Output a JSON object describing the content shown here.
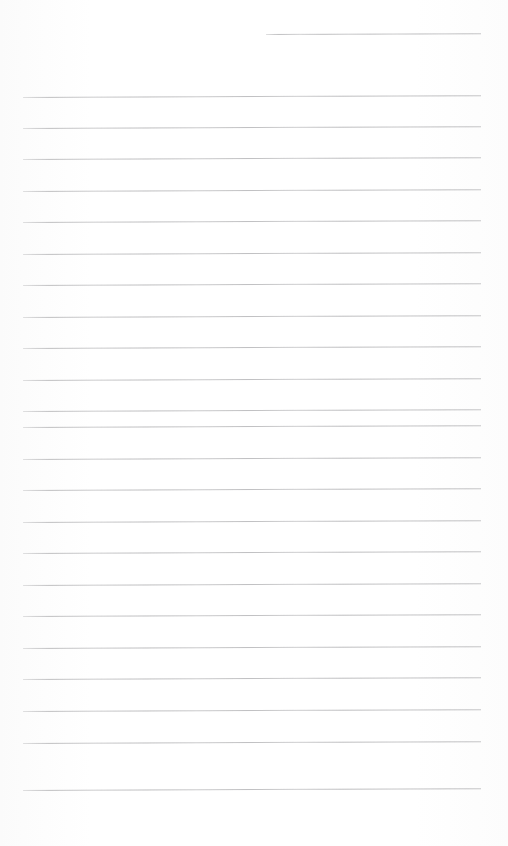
{
  "document": {
    "kind": "blank-ruled-notebook-page",
    "title": "Blank Ruled Notebook Page",
    "page_width": 508,
    "page_height": 846,
    "background_color": "#fdfdfd",
    "has_text_content": false,
    "written_text": "",
    "header_text": "",
    "footer_text": "",
    "page_number": ""
  },
  "ruling": {
    "line_color": "#b9b9bb",
    "line_thickness_px": 1,
    "line_spacing_px": 31.5,
    "line_count_total": 24,
    "full_width_line_count": 23,
    "partial_line_count": 1,
    "left_margin_px": 23,
    "right_margin_px": 27,
    "content_left_x": 23,
    "content_right_x": 481,
    "first_full_line_y": 97,
    "last_line_y": 790,
    "skew_degrees": -0.22,
    "lines": [
      {
        "name": "partial-top-rule",
        "y": 34,
        "x1": 266,
        "x2": 481,
        "partial": true
      },
      {
        "name": "rule-1",
        "y": 97,
        "x1": 23,
        "x2": 481,
        "partial": false
      },
      {
        "name": "rule-2",
        "y": 128,
        "x1": 23,
        "x2": 481,
        "partial": false
      },
      {
        "name": "rule-3",
        "y": 159,
        "x1": 23,
        "x2": 481,
        "partial": false
      },
      {
        "name": "rule-4",
        "y": 191,
        "x1": 23,
        "x2": 481,
        "partial": false
      },
      {
        "name": "rule-5",
        "y": 222,
        "x1": 23,
        "x2": 481,
        "partial": false
      },
      {
        "name": "rule-6",
        "y": 254,
        "x1": 23,
        "x2": 481,
        "partial": false
      },
      {
        "name": "rule-7",
        "y": 285,
        "x1": 23,
        "x2": 481,
        "partial": false
      },
      {
        "name": "rule-8",
        "y": 317,
        "x1": 23,
        "x2": 481,
        "partial": false
      },
      {
        "name": "rule-9",
        "y": 348,
        "x1": 23,
        "x2": 481,
        "partial": false
      },
      {
        "name": "rule-10",
        "y": 380,
        "x1": 23,
        "x2": 481,
        "partial": false
      },
      {
        "name": "rule-11",
        "y": 411,
        "x1": 23,
        "x2": 481,
        "partial": false
      },
      {
        "name": "rule-12",
        "y": 427,
        "x1": 23,
        "x2": 481,
        "partial": false
      },
      {
        "name": "rule-13",
        "y": 459,
        "x1": 23,
        "x2": 481,
        "partial": false
      },
      {
        "name": "rule-14",
        "y": 490,
        "x1": 23,
        "x2": 481,
        "partial": false
      },
      {
        "name": "rule-15",
        "y": 522,
        "x1": 23,
        "x2": 481,
        "partial": false
      },
      {
        "name": "rule-16",
        "y": 553,
        "x1": 23,
        "x2": 481,
        "partial": false
      },
      {
        "name": "rule-17",
        "y": 585,
        "x1": 23,
        "x2": 481,
        "partial": false
      },
      {
        "name": "rule-18",
        "y": 616,
        "x1": 23,
        "x2": 481,
        "partial": false
      },
      {
        "name": "rule-19",
        "y": 648,
        "x1": 23,
        "x2": 481,
        "partial": false
      },
      {
        "name": "rule-20",
        "y": 679,
        "x1": 23,
        "x2": 481,
        "partial": false
      },
      {
        "name": "rule-21",
        "y": 711,
        "x1": 23,
        "x2": 481,
        "partial": false
      },
      {
        "name": "rule-22",
        "y": 743,
        "x1": 23,
        "x2": 481,
        "partial": false
      },
      {
        "name": "rule-23",
        "y": 790,
        "x1": 23,
        "x2": 481,
        "partial": false
      }
    ]
  },
  "margins": {
    "top_label": "",
    "bottom_label": "",
    "left_label": "",
    "right_label": ""
  }
}
